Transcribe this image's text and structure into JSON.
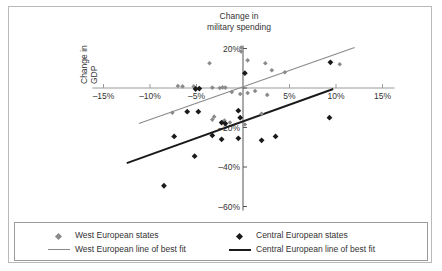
{
  "chart_data": {
    "type": "scatter",
    "title_line1": "Change in",
    "title_line2": "military spending",
    "ylabel": "Change in military spending",
    "xlabel": "Change in GDP",
    "xlabel_line1": "Change in",
    "xlabel_line2": "GDP",
    "xlim": [
      -16.5,
      16.5
    ],
    "ylim": [
      -63,
      23
    ],
    "grid": false,
    "legend_position": "bottom",
    "x_ticks": [
      -15,
      -10,
      -5,
      5,
      10,
      15
    ],
    "x_tick_labels": [
      "–15%",
      "–10%",
      "–5%",
      "5%",
      "10%",
      "15%"
    ],
    "y_ticks": [
      20,
      0,
      -20,
      -40,
      -60
    ],
    "y_tick_labels": [
      "20%",
      "",
      "–20%",
      "–40%",
      "–60%"
    ],
    "series": [
      {
        "name": "West European states",
        "marker": "diamond",
        "color": "#8a8a8a",
        "points": [
          [
            -0.2,
            20.5
          ],
          [
            -0.2,
            18.5
          ],
          [
            -3.6,
            12.5
          ],
          [
            0.5,
            14.0
          ],
          [
            2.4,
            12.5
          ],
          [
            3.1,
            9.0
          ],
          [
            4.5,
            8.0
          ],
          [
            10.4,
            12.0
          ],
          [
            -7.0,
            1.0
          ],
          [
            -6.5,
            0.8
          ],
          [
            -5.3,
            0.8
          ],
          [
            -3.3,
            0.2
          ],
          [
            -2.5,
            0.0
          ],
          [
            -2.2,
            0.3
          ],
          [
            -1.9,
            0.2
          ],
          [
            0.5,
            -2.5
          ],
          [
            1.3,
            -1.5
          ],
          [
            2.6,
            -3.5
          ],
          [
            -1.2,
            -2.0
          ],
          [
            -0.3,
            -3.0
          ],
          [
            -7.6,
            -12.5
          ],
          [
            -3.1,
            -14.5
          ],
          [
            -3.3,
            -16.0
          ],
          [
            -1.4,
            -17.5
          ],
          [
            -2.0,
            -16.5
          ],
          [
            2.0,
            -13.0
          ],
          [
            0.2,
            -18.5
          ]
        ]
      },
      {
        "name": "Central European states",
        "marker": "diamond",
        "color": "#1a1a1a",
        "points": [
          [
            0.2,
            7.5
          ],
          [
            9.4,
            13.0
          ],
          [
            -5.1,
            -0.5
          ],
          [
            -4.7,
            -0.3
          ],
          [
            -6.0,
            -12.0
          ],
          [
            -4.8,
            -12.0
          ],
          [
            -0.5,
            -11.5
          ],
          [
            -0.3,
            -15.0
          ],
          [
            -2.3,
            -17.5
          ],
          [
            -1.9,
            -18.0
          ],
          [
            3.5,
            -24.5
          ],
          [
            9.3,
            -15.0
          ],
          [
            -3.3,
            -24.0
          ],
          [
            -2.3,
            -26.0
          ],
          [
            -0.5,
            -25.5
          ],
          [
            -7.4,
            -24.5
          ],
          [
            2.0,
            -26.5
          ],
          [
            -5.2,
            -34.5
          ],
          [
            -8.5,
            -49.5
          ]
        ]
      }
    ],
    "best_fit_lines": [
      {
        "name": "West European line of best fit",
        "color": "#8a8a8a",
        "x1": -11.2,
        "y1": -18.0,
        "x2": 12.0,
        "y2": 20.5
      },
      {
        "name": "Central European line of best fit",
        "color": "#1a1a1a",
        "x1": -12.5,
        "y1": -38.0,
        "x2": 9.7,
        "y2": -0.5
      }
    ]
  },
  "legend": {
    "entries": [
      {
        "label": "West European states",
        "type": "marker",
        "color": "#8a8a8a"
      },
      {
        "label": "Central European states",
        "type": "marker",
        "color": "#1a1a1a"
      },
      {
        "label": "West European line of best fit",
        "type": "line",
        "color": "#8a8a8a"
      },
      {
        "label": "Central European line of best fit",
        "type": "line",
        "color": "#1a1a1a"
      }
    ]
  }
}
